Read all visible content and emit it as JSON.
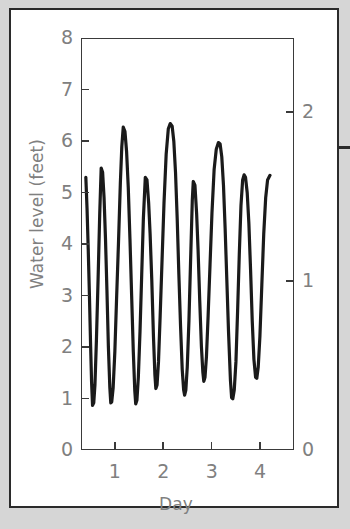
{
  "figure": {
    "title_line1": "Savannah River",
    "title_line2": "Entrance",
    "right_marker_name": "edge-rule-mark"
  },
  "chart_data": {
    "type": "line",
    "title": "Savannah River Entrance",
    "xlabel": "Day",
    "ylabel": "Water level (feet)",
    "ylabel_right": "Water level (m)",
    "xlim": [
      0.3,
      4.7
    ],
    "ylim": [
      0,
      8
    ],
    "ylim_right": [
      0,
      2.4384
    ],
    "grid": false,
    "legend": null,
    "line_color": "#1a1a1a",
    "line_width_px": 3.2,
    "xticks": [
      1,
      2,
      3,
      4
    ],
    "xtick_labels": [
      "1",
      "2",
      "3",
      "4"
    ],
    "yticks_left": [
      0,
      1,
      2,
      3,
      4,
      5,
      6,
      7,
      8
    ],
    "ytick_labels_left": [
      "0",
      "1",
      "2",
      "3",
      "4",
      "5",
      "6",
      "7",
      "8"
    ],
    "yticks_right": [
      0,
      1,
      2
    ],
    "ytick_labels_right": [
      "0",
      "1",
      "2"
    ],
    "extrema": [
      {
        "day": 0.38,
        "feet": 5.3,
        "kind": "start"
      },
      {
        "day": 0.52,
        "feet": 0.85,
        "kind": "low"
      },
      {
        "day": 0.7,
        "feet": 5.48,
        "kind": "high"
      },
      {
        "day": 0.9,
        "feet": 0.9,
        "kind": "low"
      },
      {
        "day": 1.16,
        "feet": 6.28,
        "kind": "higher-high"
      },
      {
        "day": 1.4,
        "feet": 0.88,
        "kind": "low"
      },
      {
        "day": 1.62,
        "feet": 5.3,
        "kind": "high"
      },
      {
        "day": 1.84,
        "feet": 1.18,
        "kind": "low"
      },
      {
        "day": 2.18,
        "feet": 6.35,
        "kind": "higher-high"
      },
      {
        "day": 2.42,
        "feet": 1.05,
        "kind": "low"
      },
      {
        "day": 2.62,
        "feet": 5.22,
        "kind": "high"
      },
      {
        "day": 2.84,
        "feet": 1.32,
        "kind": "low"
      },
      {
        "day": 3.18,
        "feet": 5.98,
        "kind": "higher-high"
      },
      {
        "day": 3.42,
        "feet": 0.98,
        "kind": "low"
      },
      {
        "day": 3.68,
        "feet": 5.35,
        "kind": "high"
      },
      {
        "day": 3.92,
        "feet": 1.38,
        "kind": "low"
      },
      {
        "day": 4.22,
        "feet": 5.34,
        "kind": "end-high"
      }
    ],
    "series": [
      {
        "name": "Water level",
        "x": [
          0.38,
          0.405,
          0.43,
          0.455,
          0.48,
          0.5,
          0.52,
          0.545,
          0.57,
          0.6,
          0.635,
          0.67,
          0.7,
          0.73,
          0.76,
          0.79,
          0.82,
          0.85,
          0.88,
          0.9,
          0.92,
          0.95,
          0.985,
          1.02,
          1.06,
          1.1,
          1.13,
          1.16,
          1.195,
          1.23,
          1.265,
          1.3,
          1.335,
          1.37,
          1.4,
          1.42,
          1.445,
          1.475,
          1.51,
          1.545,
          1.58,
          1.62,
          1.655,
          1.69,
          1.72,
          1.755,
          1.79,
          1.82,
          1.84,
          1.865,
          1.895,
          1.93,
          1.97,
          2.01,
          2.055,
          2.1,
          2.14,
          2.18,
          2.215,
          2.25,
          2.285,
          2.32,
          2.355,
          2.39,
          2.42,
          2.44,
          2.465,
          2.495,
          2.53,
          2.565,
          2.6,
          2.62,
          2.655,
          2.69,
          2.72,
          2.755,
          2.79,
          2.82,
          2.84,
          2.865,
          2.895,
          2.93,
          2.97,
          3.01,
          3.055,
          3.1,
          3.145,
          3.18,
          3.215,
          3.25,
          3.285,
          3.32,
          3.355,
          3.395,
          3.42,
          3.445,
          3.475,
          3.51,
          3.545,
          3.58,
          3.615,
          3.65,
          3.68,
          3.71,
          3.745,
          3.78,
          3.815,
          3.85,
          3.885,
          3.92,
          3.945,
          3.975,
          4.01,
          4.05,
          4.09,
          4.13,
          4.17,
          4.22
        ],
        "y": [
          5.3,
          4.7,
          3.9,
          3.0,
          2.0,
          1.3,
          0.85,
          0.9,
          1.25,
          2.1,
          3.3,
          4.6,
          5.48,
          5.4,
          4.9,
          4.1,
          3.1,
          2.0,
          1.2,
          0.9,
          0.92,
          1.2,
          1.9,
          2.9,
          4.0,
          5.2,
          5.9,
          6.28,
          6.2,
          5.8,
          5.1,
          4.1,
          3.0,
          1.9,
          1.15,
          0.88,
          0.95,
          1.4,
          2.3,
          3.4,
          4.5,
          5.3,
          5.25,
          4.8,
          4.2,
          3.3,
          2.2,
          1.45,
          1.18,
          1.25,
          1.7,
          2.6,
          3.7,
          4.8,
          5.75,
          6.25,
          6.35,
          6.3,
          6.0,
          5.4,
          4.5,
          3.4,
          2.4,
          1.55,
          1.15,
          1.05,
          1.15,
          1.6,
          2.5,
          3.7,
          4.85,
          5.22,
          5.15,
          4.6,
          3.9,
          2.9,
          2.0,
          1.5,
          1.32,
          1.4,
          1.8,
          2.6,
          3.6,
          4.6,
          5.45,
          5.85,
          5.98,
          5.95,
          5.7,
          5.15,
          4.3,
          3.3,
          2.3,
          1.35,
          1.0,
          0.98,
          1.15,
          1.7,
          2.7,
          3.8,
          4.75,
          5.25,
          5.35,
          5.3,
          5.0,
          4.4,
          3.5,
          2.5,
          1.75,
          1.4,
          1.38,
          1.6,
          2.2,
          3.2,
          4.2,
          4.9,
          5.25,
          5.34
        ]
      }
    ]
  },
  "axes": {
    "left_ticks": [
      {
        "value": 8,
        "label": "8"
      },
      {
        "value": 7,
        "label": "7"
      },
      {
        "value": 6,
        "label": "6"
      },
      {
        "value": 5,
        "label": "5"
      },
      {
        "value": 4,
        "label": "4"
      },
      {
        "value": 3,
        "label": "3"
      },
      {
        "value": 2,
        "label": "2"
      },
      {
        "value": 1,
        "label": "1"
      },
      {
        "value": 0,
        "label": "0"
      }
    ],
    "right_ticks": [
      {
        "value": 2,
        "label": "2"
      },
      {
        "value": 1,
        "label": "1"
      },
      {
        "value": 0,
        "label": "0"
      }
    ],
    "bottom_ticks": [
      {
        "value": 1,
        "label": "1"
      },
      {
        "value": 2,
        "label": "2"
      },
      {
        "value": 3,
        "label": "3"
      },
      {
        "value": 4,
        "label": "4"
      }
    ]
  },
  "colors": {
    "page_background": "#d6d6d6",
    "figure_background": "#ffffff",
    "frame": "#2b2b2b",
    "axis": "#3a3a3a",
    "tick_text": "#808080",
    "title_text": "#000000",
    "curve": "#1a1a1a"
  }
}
